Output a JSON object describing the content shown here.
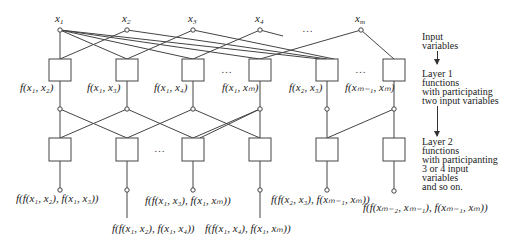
{
  "diagram": {
    "type": "layered-network",
    "inputs": [
      {
        "id": "x1",
        "label": "x",
        "sub": "1"
      },
      {
        "id": "x2",
        "label": "x",
        "sub": "2"
      },
      {
        "id": "x3",
        "label": "x",
        "sub": "3"
      },
      {
        "id": "x4",
        "label": "x",
        "sub": "4"
      },
      {
        "id": "xm",
        "label": "x",
        "sub": "m"
      }
    ],
    "ellipsis": "…",
    "layer1": {
      "labels": [
        "f(x₁, x₂)",
        "f(x₁, x₃)",
        "f(x₁, x₄)",
        "f(x₁, xₘ)",
        "f(x₂, x₃)",
        "f(xₘ₋₁, xₘ)"
      ]
    },
    "layer2": {
      "labels": [
        "f(f(x₁, x₂), f(x₁, x₃))",
        "f(f(x₁, x₂), f(x₁, x₄))",
        "f(f(x₁, x₃), f(x₁, xₘ))",
        "f(f(x₁, x₄), f(x₁, xₘ))",
        "f(f(x₂, x₃), f(xₘ₋₁, xₘ))",
        "f(f(xₘ₋₂, xₘ₋₁), f(xₘ₋₁, xₘ))"
      ]
    },
    "legend": {
      "input": "Input\nvariables",
      "layer1": "Layer 1\nfunctions\nwith participating\ntwo input variables",
      "layer2": "Layer 2\nfunctions\nwith participanting\n3 or 4 input\nvariables\nand so on."
    }
  }
}
